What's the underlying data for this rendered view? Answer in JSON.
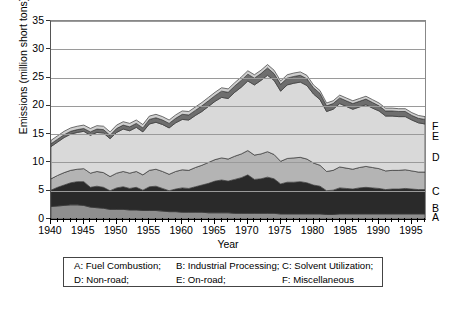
{
  "chart_data": {
    "type": "area",
    "stacked": true,
    "title": "",
    "xlabel": "Year",
    "ylabel": "Emissions (million short tons)",
    "xlim": [
      1940,
      1997
    ],
    "ylim": [
      0,
      35
    ],
    "yticks": [
      0,
      5,
      10,
      15,
      20,
      25,
      30,
      35
    ],
    "xticks": [
      1940,
      1945,
      1950,
      1955,
      1960,
      1965,
      1970,
      1975,
      1980,
      1985,
      1990,
      1995
    ],
    "xtick_labels": [
      "1940",
      "1945",
      "1950",
      "1955",
      "1960",
      "1965",
      "1970",
      "1975",
      "1980",
      "1985",
      "1990",
      "1995"
    ],
    "ytick_labels": [
      "0",
      "5",
      "10",
      "15",
      "20",
      "25",
      "30",
      "35"
    ],
    "grid": "horizontal",
    "legend_position": "below",
    "x": [
      1940,
      1941,
      1942,
      1943,
      1944,
      1945,
      1946,
      1947,
      1948,
      1949,
      1950,
      1951,
      1952,
      1953,
      1954,
      1955,
      1956,
      1957,
      1958,
      1959,
      1960,
      1961,
      1962,
      1963,
      1964,
      1965,
      1966,
      1967,
      1968,
      1969,
      1970,
      1971,
      1972,
      1973,
      1974,
      1975,
      1976,
      1977,
      1978,
      1979,
      1980,
      1981,
      1982,
      1983,
      1984,
      1985,
      1986,
      1987,
      1988,
      1989,
      1990,
      1991,
      1992,
      1993,
      1994,
      1995,
      1996,
      1997
    ],
    "series": [
      {
        "key": "A",
        "name": "Fuel Combustion",
        "color": "#8f8f8f",
        "values": [
          2.2,
          2.3,
          2.4,
          2.5,
          2.5,
          2.4,
          2.1,
          2.0,
          1.9,
          1.7,
          1.7,
          1.7,
          1.6,
          1.6,
          1.5,
          1.5,
          1.5,
          1.4,
          1.3,
          1.3,
          1.2,
          1.2,
          1.2,
          1.2,
          1.1,
          1.1,
          1.1,
          1.1,
          1.0,
          1.0,
          1.0,
          1.0,
          1.0,
          1.0,
          1.0,
          0.9,
          0.9,
          0.9,
          0.9,
          0.9,
          0.9,
          0.9,
          0.8,
          0.8,
          0.9,
          0.9,
          0.9,
          0.9,
          0.9,
          0.9,
          0.9,
          0.9,
          0.9,
          0.9,
          0.9,
          0.9,
          0.9,
          0.9
        ]
      },
      {
        "key": "B",
        "name": "Industrial Processing",
        "color": "#2a2a2a",
        "values": [
          2.9,
          3.3,
          3.6,
          3.9,
          4.1,
          4.2,
          3.5,
          3.8,
          3.7,
          3.3,
          3.8,
          4.0,
          3.8,
          4.0,
          3.6,
          4.2,
          4.3,
          4.0,
          3.7,
          4.0,
          4.3,
          4.2,
          4.5,
          4.8,
          5.2,
          5.6,
          5.8,
          5.6,
          6.0,
          6.3,
          6.8,
          6.0,
          6.1,
          6.4,
          6.1,
          5.3,
          5.6,
          5.6,
          5.7,
          5.5,
          5.1,
          4.9,
          4.2,
          4.3,
          4.6,
          4.5,
          4.4,
          4.6,
          4.7,
          4.6,
          4.5,
          4.3,
          4.4,
          4.4,
          4.5,
          4.4,
          4.3,
          4.3
        ]
      },
      {
        "key": "C",
        "name": "Solvent Utilization",
        "color": "#b4b4b4",
        "values": [
          2.0,
          2.1,
          2.2,
          2.2,
          2.2,
          2.3,
          2.5,
          2.6,
          2.6,
          2.5,
          2.6,
          2.7,
          2.7,
          2.8,
          2.7,
          2.9,
          3.0,
          3.0,
          2.9,
          3.1,
          3.2,
          3.2,
          3.4,
          3.5,
          3.7,
          3.8,
          3.9,
          3.9,
          4.1,
          4.2,
          4.3,
          4.3,
          4.4,
          4.5,
          4.3,
          4.0,
          4.2,
          4.3,
          4.3,
          4.2,
          3.9,
          3.7,
          3.4,
          3.5,
          3.7,
          3.6,
          3.5,
          3.6,
          3.7,
          3.6,
          3.5,
          3.3,
          3.3,
          3.3,
          3.3,
          3.2,
          3.1,
          3.1
        ]
      },
      {
        "key": "D",
        "name": "Non-road",
        "color": "#d9d9d9",
        "values": [
          5.7,
          5.9,
          6.2,
          6.4,
          6.5,
          6.6,
          6.7,
          6.9,
          7.0,
          6.7,
          7.2,
          7.5,
          7.5,
          7.8,
          7.6,
          8.2,
          8.3,
          8.3,
          8.2,
          8.6,
          8.9,
          8.9,
          9.2,
          9.5,
          9.9,
          10.3,
          10.7,
          10.7,
          11.3,
          11.8,
          12.3,
          12.4,
          13.0,
          13.5,
          13.1,
          12.4,
          13.0,
          13.2,
          13.3,
          13.0,
          12.2,
          11.6,
          10.6,
          10.8,
          11.2,
          10.9,
          10.6,
          10.7,
          10.9,
          10.5,
          10.2,
          9.7,
          9.6,
          9.5,
          9.4,
          9.0,
          8.7,
          8.5
        ]
      },
      {
        "key": "E",
        "name": "On-road",
        "color": "#6e6e6e",
        "values": [
          0.5,
          0.5,
          0.5,
          0.5,
          0.5,
          0.5,
          0.6,
          0.6,
          0.6,
          0.6,
          0.7,
          0.7,
          0.7,
          0.7,
          0.7,
          0.8,
          0.8,
          0.8,
          0.8,
          0.8,
          0.9,
          0.9,
          0.9,
          1.0,
          1.0,
          1.0,
          1.1,
          1.1,
          1.1,
          1.2,
          1.2,
          1.2,
          1.2,
          1.3,
          1.2,
          1.2,
          1.2,
          1.2,
          1.2,
          1.2,
          1.1,
          1.1,
          1.0,
          1.0,
          1.0,
          1.0,
          1.0,
          1.0,
          1.0,
          1.0,
          0.9,
          0.9,
          0.9,
          0.9,
          0.9,
          0.8,
          0.8,
          0.8
        ]
      },
      {
        "key": "F",
        "name": "Miscellaneous",
        "color": "#cfcfcf",
        "values": [
          0.6,
          0.6,
          0.6,
          0.6,
          0.6,
          0.6,
          0.6,
          0.6,
          0.6,
          0.6,
          0.6,
          0.6,
          0.6,
          0.6,
          0.6,
          0.6,
          0.6,
          0.6,
          0.6,
          0.6,
          0.6,
          0.6,
          0.6,
          0.6,
          0.6,
          0.6,
          0.6,
          0.6,
          0.6,
          0.6,
          0.6,
          0.6,
          0.6,
          0.6,
          0.6,
          0.6,
          0.6,
          0.6,
          0.6,
          0.6,
          0.5,
          0.5,
          0.5,
          0.5,
          0.5,
          0.5,
          0.5,
          0.5,
          0.5,
          0.5,
          0.5,
          0.5,
          0.5,
          0.5,
          0.5,
          0.5,
          0.5,
          0.5
        ]
      }
    ],
    "totals_note": "Stacked totals peak near 31 around 1970 and decline to about 18 by 1997"
  },
  "axis": {
    "ylabel": "Emissions (million short tons)",
    "xlabel": "Year"
  },
  "series_labels": [
    {
      "key": "F",
      "y": 121
    },
    {
      "key": "E",
      "y": 131
    },
    {
      "key": "D",
      "y": 152
    },
    {
      "key": "C",
      "y": 186
    },
    {
      "key": "B",
      "y": 203
    },
    {
      "key": "A",
      "y": 212
    }
  ],
  "legend": {
    "row1": [
      "A: Fuel Combustion;",
      "B: Industrial Processing;",
      "C: Solvent Utilization;"
    ],
    "row2": [
      "D: Non-road;",
      "E: On-road;",
      "F: Miscellaneous"
    ]
  },
  "caption": ""
}
